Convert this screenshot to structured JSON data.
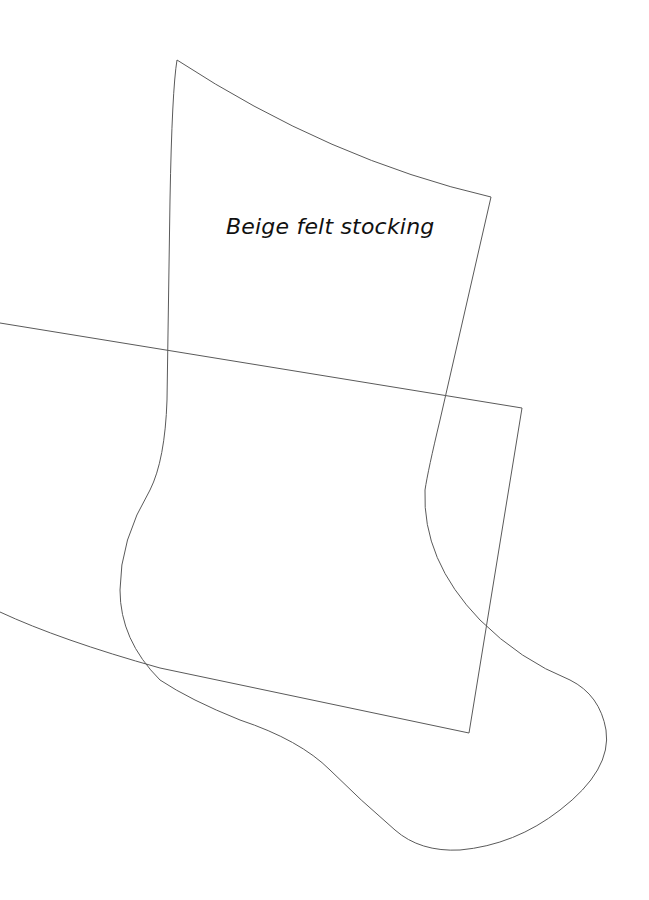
{
  "diagram": {
    "type": "sewing-pattern",
    "label": "Beige felt stocking",
    "colors": {
      "background": "#ffffff",
      "stroke": "#5a5a5a",
      "text": "#111111"
    },
    "pieces": [
      {
        "name": "stocking-outline",
        "shape": "stocking"
      },
      {
        "name": "cuff-rectangle",
        "shape": "rotated-quadrilateral"
      }
    ]
  }
}
